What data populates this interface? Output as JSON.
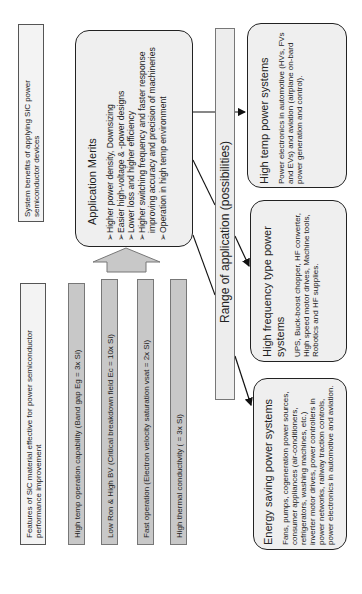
{
  "system_benefits": {
    "label": "System benefits of applying SiC power semiconductor devices"
  },
  "application_merits": {
    "title": "Application Merits",
    "items": [
      "➢Higher power density, Downsizing",
      "➢Easier high-voltage & -power designs",
      "➢Lower loss and higher efficiency",
      "➢Higher switching frequency and faster response",
      "   improving  accuracy and precision of machineries",
      "➢Operation in high temp environment"
    ]
  },
  "features": {
    "header": "Features of SiC material effective for power semiconductor performance improvement",
    "items": [
      "High temp operation capability (Band gap Eg = 3x Si)",
      "Low Ron & High BV (Critical breakdown field Ec = 10x Si)",
      "Fast operation (Electron velocity saturation vsat = 2x Si)",
      "High thermal conductivity (  = 3x Si)"
    ]
  },
  "range": {
    "label": "Range of application (possibilities)"
  },
  "applications": [
    {
      "title": "High temp power systems",
      "body": "Power electronics in automotive (HVs, FVs and EVs) and aviation (airplane on-bard power generation and control)."
    },
    {
      "title": "High frequency type power systems",
      "body": "UPS, Buck-boost chopper, HF converter, High speed motor drives, Machine tools, Robotics and HF supplies."
    },
    {
      "title": "Energy saving power systems",
      "body": "Fans, pumps, cogeneration power sources, consumer appliances (air-conditioners, refrigerators, washing machines, etc.) inverter motor drives, power controllers in power networks, railway traction controls, power electronics in automotive and aviation."
    }
  ],
  "colors": {
    "bar_fill": "#c8c8c8",
    "box_fill": "#efefef",
    "border": "#222222"
  }
}
